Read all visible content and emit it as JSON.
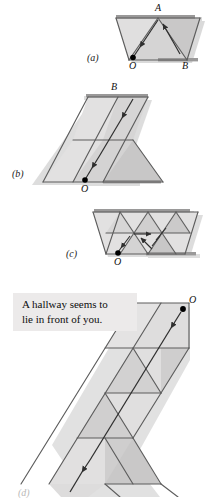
{
  "figure": {
    "panels": [
      {
        "id": "a",
        "label": "(a)"
      },
      {
        "id": "b",
        "label": "(b)"
      },
      {
        "id": "c",
        "label": "(c)"
      },
      {
        "id": "d",
        "label": "(d)"
      }
    ],
    "vertex_labels": {
      "a_top": "A",
      "a_origin": "O",
      "a_right": "B",
      "b_top": "B",
      "b_origin": "O",
      "c_origin": "O",
      "d_origin": "O"
    },
    "caption": {
      "line1": "A hallway seems to",
      "line2": "lie in front of you."
    },
    "colors": {
      "background": "#ffffff",
      "face_light": "#e4e3e3",
      "face_mid": "#d6d5d5",
      "face_dark": "#c9c8c8",
      "edge": "#5d5d5d",
      "edge_dark": "#3f3f3f",
      "shadow": "#bdbcbc",
      "caption_bg": "#eceaea",
      "text": "#111111",
      "arrow": "#2e2e2e",
      "dot": "#000000"
    }
  }
}
